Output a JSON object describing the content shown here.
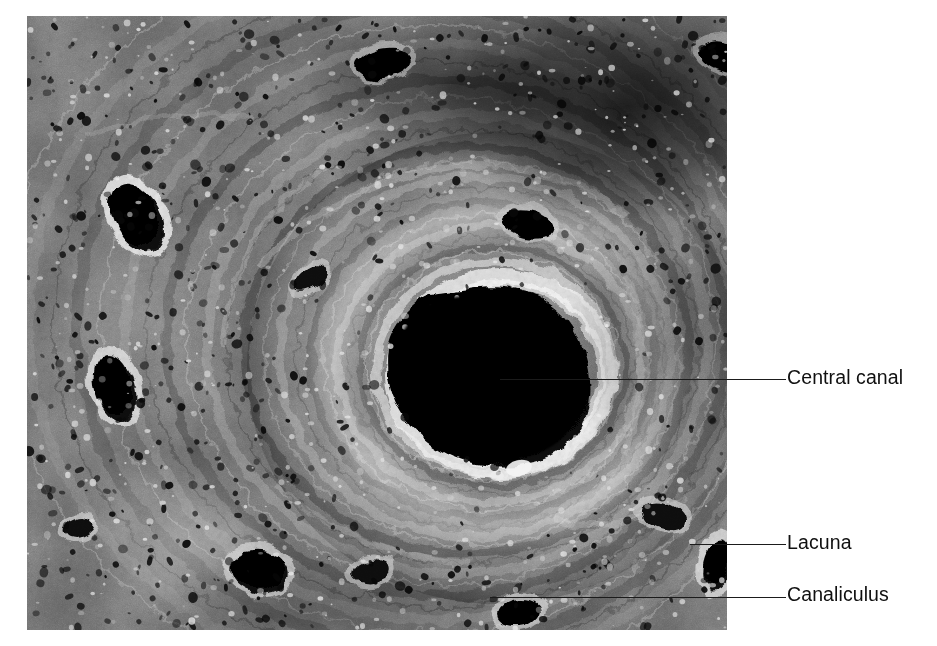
{
  "figure": {
    "kind": "scanning-electron-micrograph",
    "background_color": "#ffffff",
    "image_panel": {
      "left": 27,
      "top": 16,
      "width": 700,
      "height": 614,
      "palette": {
        "shadow": "#050505",
        "dark": "#1d1d1d",
        "mid": "#6a6a6a",
        "light": "#bdbdbd",
        "highlight": "#f2f2f2"
      }
    }
  },
  "annotations": {
    "text_color": "#101010",
    "leader_color": "#1b1b1b",
    "items": [
      {
        "id": "central-canal",
        "label": "Central canal",
        "label_x": 787,
        "label_y": 368,
        "leader_x1": 500,
        "leader_y1": 378,
        "leader_x2": 786,
        "leader_y2": 378
      },
      {
        "id": "lacuna",
        "label": "Lacuna",
        "label_x": 787,
        "label_y": 533,
        "leader_x1": 690,
        "leader_y1": 543,
        "leader_x2": 786,
        "leader_y2": 543
      },
      {
        "id": "canaliculus",
        "label": "Canaliculus",
        "label_x": 787,
        "label_y": 585,
        "leader_x1": 490,
        "leader_y1": 596,
        "leader_x2": 786,
        "leader_y2": 596
      }
    ]
  },
  "features": {
    "central_canal": {
      "name": "central-canal",
      "cx": 475,
      "cy": 360,
      "rx": 92,
      "ry": 82,
      "fill": "#040404"
    },
    "lacunae": [
      {
        "name": "lacuna-upper-left",
        "cx": 110,
        "cy": 200,
        "rx": 26,
        "ry": 40,
        "rot": -28
      },
      {
        "name": "lacuna-left",
        "cx": 88,
        "cy": 370,
        "rx": 22,
        "ry": 36,
        "rot": -18
      },
      {
        "name": "lacuna-top",
        "cx": 357,
        "cy": 48,
        "rx": 30,
        "ry": 17,
        "rot": -8
      },
      {
        "name": "lacuna-top-right",
        "cx": 700,
        "cy": 42,
        "rx": 30,
        "ry": 16,
        "rot": 18
      },
      {
        "name": "lacuna-upper-mid",
        "cx": 283,
        "cy": 262,
        "rx": 19,
        "ry": 11,
        "rot": -32
      },
      {
        "name": "lacuna-mid-right",
        "cx": 500,
        "cy": 208,
        "rx": 28,
        "ry": 15,
        "rot": 14
      },
      {
        "name": "lacuna-lower-left",
        "cx": 232,
        "cy": 556,
        "rx": 30,
        "ry": 22,
        "rot": 10
      },
      {
        "name": "lacuna-lower-mid",
        "cx": 345,
        "cy": 556,
        "rx": 20,
        "ry": 13,
        "rot": -12
      },
      {
        "name": "lacuna-canaliculus-target",
        "cx": 492,
        "cy": 597,
        "rx": 22,
        "ry": 14,
        "rot": -6
      },
      {
        "name": "lacuna-label-target",
        "cx": 690,
        "cy": 548,
        "rx": 15,
        "ry": 27,
        "rot": 12
      },
      {
        "name": "lacuna-bottom-right",
        "cx": 636,
        "cy": 500,
        "rx": 22,
        "ry": 14,
        "rot": 22
      },
      {
        "name": "lacuna-far-left-low",
        "cx": 52,
        "cy": 512,
        "rx": 16,
        "ry": 10,
        "rot": -20
      }
    ],
    "lamellae_rings": 9,
    "canaliculi_count": 900
  }
}
